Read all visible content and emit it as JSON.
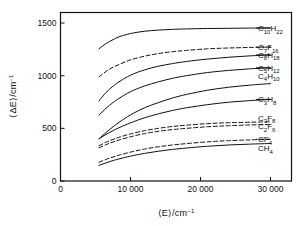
{
  "chart_data": {
    "type": "line",
    "title": "",
    "xlabel": "<E>/cm-1",
    "ylabel": "<ΔE>/cm-1",
    "xlabel_parts": {
      "lead": "⟨E⟩/cm",
      "exp": "−1"
    },
    "ylabel_parts": {
      "lead": "⟨ΔE⟩/cm",
      "exp": "−1"
    },
    "xlim": [
      0,
      33000
    ],
    "ylim": [
      0,
      1600
    ],
    "xticks": [
      0,
      10000,
      20000,
      30000
    ],
    "xticklabels": [
      "0",
      "10 000",
      "20 000",
      "30 000"
    ],
    "yticks": [
      0,
      500,
      1000,
      1500
    ],
    "yticklabels": [
      "0",
      "500",
      "1000",
      "1500"
    ],
    "grid": false,
    "legend": "inline-right-labels",
    "x": [
      5500,
      6500,
      7500,
      8500,
      10000,
      12000,
      14000,
      16000,
      18000,
      21000,
      24000,
      27000,
      30000
    ],
    "series": [
      {
        "name": "C10H22",
        "label_lead": "C",
        "label_sub1": "10",
        "label_mid": "H",
        "label_sub2": "22",
        "style": "solid",
        "values": [
          1255,
          1305,
          1342,
          1372,
          1400,
          1422,
          1433,
          1440,
          1444,
          1448,
          1450,
          1452,
          1453
        ]
      },
      {
        "name": "C7F16",
        "label_lead": "C",
        "label_sub1": "7",
        "label_mid": "F",
        "label_sub2": "16",
        "style": "dashed",
        "values": [
          990,
          1040,
          1080,
          1110,
          1150,
          1185,
          1210,
          1228,
          1240,
          1255,
          1263,
          1268,
          1272
        ]
      },
      {
        "name": "C8H18",
        "label_lead": "C",
        "label_sub1": "8",
        "label_mid": "H",
        "label_sub2": "18",
        "style": "solid",
        "values": [
          760,
          840,
          900,
          948,
          1005,
          1055,
          1090,
          1115,
          1135,
          1158,
          1175,
          1188,
          1197
        ]
      },
      {
        "name": "C5H12",
        "label_lead": "C",
        "label_sub1": "5",
        "label_mid": "H",
        "label_sub2": "12",
        "style": "solid",
        "values": [
          625,
          690,
          745,
          790,
          848,
          902,
          942,
          975,
          1000,
          1030,
          1050,
          1065,
          1075
        ]
      },
      {
        "name": "C4H10",
        "label_lead": "C",
        "label_sub1": "4",
        "label_mid": "H",
        "label_sub2": "10",
        "style": "solid",
        "values": [
          400,
          460,
          515,
          563,
          628,
          695,
          745,
          788,
          822,
          862,
          890,
          910,
          925
        ]
      },
      {
        "name": "C3H8",
        "label_lead": "C",
        "label_sub1": "3",
        "label_mid": "H",
        "label_sub2": "8",
        "style": "solid",
        "values": [
          400,
          442,
          478,
          510,
          552,
          600,
          638,
          670,
          695,
          725,
          748,
          763,
          775
        ]
      },
      {
        "name": "C3F8",
        "label_lead": "C",
        "label_sub1": "3",
        "label_mid": "F",
        "label_sub2": "8",
        "style": "dashed",
        "values": [
          335,
          368,
          395,
          418,
          447,
          478,
          500,
          518,
          530,
          545,
          553,
          558,
          562
        ]
      },
      {
        "name": "C2F6",
        "label_lead": "C",
        "label_sub1": "2",
        "label_mid": "F",
        "label_sub2": "6",
        "style": "dashed",
        "values": [
          315,
          345,
          370,
          392,
          420,
          450,
          472,
          488,
          500,
          515,
          525,
          532,
          537
        ]
      },
      {
        "name": "CF4",
        "label_lead": "C",
        "label_sub1": "",
        "label_mid": "F",
        "label_sub2": "4",
        "style": "dashed",
        "values": [
          178,
          205,
          228,
          248,
          274,
          303,
          325,
          342,
          355,
          372,
          383,
          390,
          396
        ]
      },
      {
        "name": "CH4",
        "label_lead": "C",
        "label_sub1": "",
        "label_mid": "H",
        "label_sub2": "4",
        "style": "solid",
        "values": [
          148,
          172,
          194,
          212,
          236,
          262,
          283,
          300,
          313,
          330,
          342,
          350,
          356
        ]
      }
    ],
    "label_positions": [
      {
        "series": "C10H22",
        "y": 1450
      },
      {
        "series": "C7F16",
        "y": 1272
      },
      {
        "series": "C8H18",
        "y": 1197
      },
      {
        "series": "C5H12",
        "y": 1075
      },
      {
        "series": "C4H10",
        "y": 1000
      },
      {
        "series": "C3H8",
        "y": 775
      },
      {
        "series": "C3F8",
        "y": 600
      },
      {
        "series": "C2F6",
        "y": 520
      },
      {
        "series": "CF4",
        "y": 396
      },
      {
        "series": "CH4",
        "y": 310
      }
    ]
  }
}
